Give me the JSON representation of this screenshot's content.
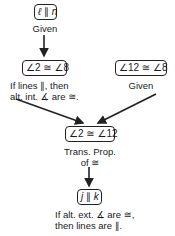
{
  "diagram": {
    "type": "flow-proof",
    "nodes": [
      {
        "id": "n1",
        "statement": "ℓ ∥ n",
        "statement_parts": [
          "ℓ",
          " ∥ ",
          "n"
        ],
        "reason": [
          "Given"
        ]
      },
      {
        "id": "n2",
        "statement": "∠2 ≅ ∠8",
        "reason": [
          "If lines ∥, then",
          "alt. int. ∡ are ≅."
        ]
      },
      {
        "id": "n3",
        "statement": "∠12 ≅ ∠8",
        "reason": [
          "Given"
        ]
      },
      {
        "id": "n4",
        "statement": "∠2 ≅ ∠12",
        "reason": [
          "Trans. Prop.",
          "of ≅"
        ]
      },
      {
        "id": "n5",
        "statement": "j ∥ k",
        "statement_parts": [
          "j",
          " ∥ ",
          "k"
        ],
        "reason": [
          "If alt. ext. ∡ are ≅,",
          "then lines are ∥."
        ]
      }
    ],
    "edges": [
      {
        "from": "n1",
        "to": "n2"
      },
      {
        "from": "n2",
        "to": "n4"
      },
      {
        "from": "n3",
        "to": "n4"
      },
      {
        "from": "n4",
        "to": "n5"
      }
    ],
    "colors": {
      "stroke": "#222222",
      "text": "#1a1a1a",
      "background": "#ffffff"
    }
  }
}
